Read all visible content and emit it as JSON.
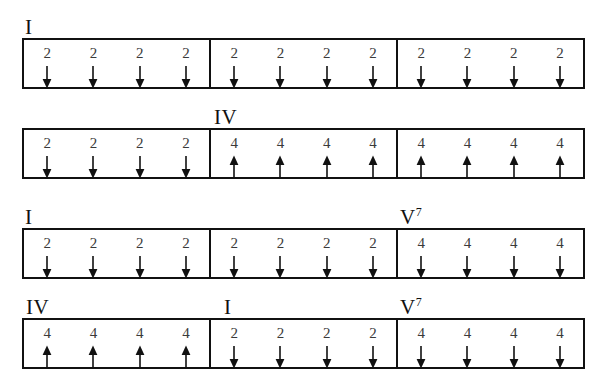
{
  "document": {
    "title": "Chord and Strum Pattern Chart",
    "beats_per_measure": 4,
    "measures_per_row": 3,
    "ink_color": "#111111",
    "count_color": "#3a3a3a",
    "background_color": "#ffffff"
  },
  "rows": [
    {
      "id": "row-1",
      "labels": [
        {
          "text": "I",
          "extension": "",
          "left_px": 25
        }
      ],
      "measures": [
        {
          "id": "r1-m1",
          "beats": [
            {
              "count": "2",
              "direction": "down"
            },
            {
              "count": "2",
              "direction": "down"
            },
            {
              "count": "2",
              "direction": "down"
            },
            {
              "count": "2",
              "direction": "down"
            }
          ]
        },
        {
          "id": "r1-m2",
          "beats": [
            {
              "count": "2",
              "direction": "down"
            },
            {
              "count": "2",
              "direction": "down"
            },
            {
              "count": "2",
              "direction": "down"
            },
            {
              "count": "2",
              "direction": "down"
            }
          ]
        },
        {
          "id": "r1-m3",
          "beats": [
            {
              "count": "2",
              "direction": "down"
            },
            {
              "count": "2",
              "direction": "down"
            },
            {
              "count": "2",
              "direction": "down"
            },
            {
              "count": "2",
              "direction": "down"
            }
          ]
        }
      ]
    },
    {
      "id": "row-2",
      "labels": [
        {
          "text": "IV",
          "extension": "",
          "left_px": 214
        }
      ],
      "measures": [
        {
          "id": "r2-m1",
          "beats": [
            {
              "count": "2",
              "direction": "down"
            },
            {
              "count": "2",
              "direction": "down"
            },
            {
              "count": "2",
              "direction": "down"
            },
            {
              "count": "2",
              "direction": "down"
            }
          ]
        },
        {
          "id": "r2-m2",
          "beats": [
            {
              "count": "4",
              "direction": "up"
            },
            {
              "count": "4",
              "direction": "up"
            },
            {
              "count": "4",
              "direction": "up"
            },
            {
              "count": "4",
              "direction": "up"
            }
          ]
        },
        {
          "id": "r2-m3",
          "beats": [
            {
              "count": "4",
              "direction": "up"
            },
            {
              "count": "4",
              "direction": "up"
            },
            {
              "count": "4",
              "direction": "up"
            },
            {
              "count": "4",
              "direction": "up"
            }
          ]
        }
      ]
    },
    {
      "id": "row-3",
      "labels": [
        {
          "text": "I",
          "extension": "",
          "left_px": 25
        },
        {
          "text": "V",
          "extension": "7",
          "left_px": 400
        }
      ],
      "measures": [
        {
          "id": "r3-m1",
          "beats": [
            {
              "count": "2",
              "direction": "down"
            },
            {
              "count": "2",
              "direction": "down"
            },
            {
              "count": "2",
              "direction": "down"
            },
            {
              "count": "2",
              "direction": "down"
            }
          ]
        },
        {
          "id": "r3-m2",
          "beats": [
            {
              "count": "2",
              "direction": "down"
            },
            {
              "count": "2",
              "direction": "down"
            },
            {
              "count": "2",
              "direction": "down"
            },
            {
              "count": "2",
              "direction": "down"
            }
          ]
        },
        {
          "id": "r3-m3",
          "beats": [
            {
              "count": "4",
              "direction": "down"
            },
            {
              "count": "4",
              "direction": "down"
            },
            {
              "count": "4",
              "direction": "down"
            },
            {
              "count": "4",
              "direction": "down"
            }
          ]
        }
      ]
    },
    {
      "id": "row-4",
      "labels": [
        {
          "text": "IV",
          "extension": "",
          "left_px": 26
        },
        {
          "text": "I",
          "extension": "",
          "left_px": 224
        },
        {
          "text": "V",
          "extension": "7",
          "left_px": 400
        }
      ],
      "measures": [
        {
          "id": "r4-m1",
          "beats": [
            {
              "count": "4",
              "direction": "up"
            },
            {
              "count": "4",
              "direction": "up"
            },
            {
              "count": "4",
              "direction": "up"
            },
            {
              "count": "4",
              "direction": "up"
            }
          ]
        },
        {
          "id": "r4-m2",
          "beats": [
            {
              "count": "2",
              "direction": "down"
            },
            {
              "count": "2",
              "direction": "down"
            },
            {
              "count": "2",
              "direction": "down"
            },
            {
              "count": "2",
              "direction": "down"
            }
          ]
        },
        {
          "id": "r4-m3",
          "beats": [
            {
              "count": "4",
              "direction": "down"
            },
            {
              "count": "4",
              "direction": "down"
            },
            {
              "count": "4",
              "direction": "down"
            },
            {
              "count": "4",
              "direction": "down"
            }
          ]
        }
      ]
    }
  ],
  "layout": {
    "row_tops": [
      8,
      98,
      198,
      288
    ],
    "system_tops": [
      38,
      128,
      228,
      318
    ],
    "system_height": 51,
    "system_left": 22,
    "system_width": 563
  }
}
